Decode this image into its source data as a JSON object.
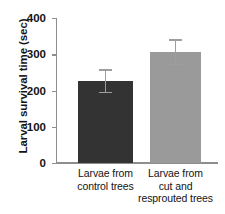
{
  "chart_data": {
    "type": "bar",
    "title": "",
    "xlabel": "",
    "ylabel": "Larval survival time (sec)",
    "categories": [
      "Larvae from control trees",
      "Larvae from cut and resprouted trees"
    ],
    "category_lines": [
      [
        "Larvae from",
        "control trees"
      ],
      [
        "Larvae from",
        "cut and",
        "resprouted trees"
      ]
    ],
    "values": [
      226,
      306
    ],
    "errors": [
      33,
      36
    ],
    "error_upper": [
      259,
      342
    ],
    "error_lower": [
      193,
      270
    ],
    "ylim": [
      0,
      400
    ],
    "yticks": [
      0,
      100,
      200,
      300,
      400
    ],
    "ytick_labels": [
      "0",
      "100",
      "200",
      "300",
      "400"
    ],
    "grid": false,
    "legend": null,
    "bar_colors": [
      "#333333",
      "#9a9a9a"
    ],
    "error_color": "#9e9e9e",
    "axis_color": "#8e8e8e",
    "text_color": "#141414"
  }
}
